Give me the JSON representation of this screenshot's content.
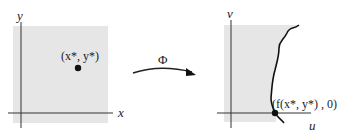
{
  "left_panel": {
    "y_axis_label": "y",
    "x_axis_label": "x",
    "point_label": "(x*, y*)",
    "region_fill": "#e6e6e6"
  },
  "mapping": {
    "label": "Φ"
  },
  "right_panel": {
    "v_axis_label": "v",
    "u_axis_label": "u",
    "point_label": "(f(x*, y*) , 0)",
    "region_fill": "#e6e6e6"
  },
  "colors": {
    "axis": "#333333",
    "curve": "#111111",
    "point": "#111111"
  }
}
